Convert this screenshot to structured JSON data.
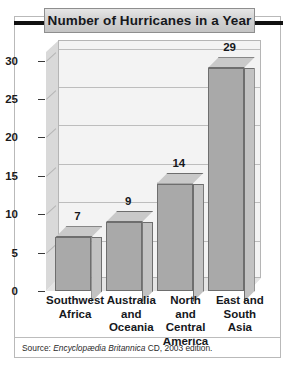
{
  "figure": {
    "title": "Number of Hurricanes in a Year",
    "source_prefix": "Source:",
    "source_work": "Encyclopædia Britannica",
    "source_suffix": "CD, 2003 edition."
  },
  "chart_data": {
    "type": "bar",
    "title": "Number of Hurricanes in a Year",
    "xlabel": "",
    "ylabel": "",
    "categories": [
      "Southwest Africa",
      "Australia and Oceania",
      "North and Central America",
      "East and South Asia"
    ],
    "category_lines": [
      [
        "Southwest",
        "Africa"
      ],
      [
        "Australia",
        "and",
        "Oceania"
      ],
      [
        "North and",
        "Central",
        "America"
      ],
      [
        "East and",
        "South Asia"
      ]
    ],
    "values": [
      7,
      9,
      14,
      29
    ],
    "value_labels": [
      "7",
      "9",
      "14",
      "29"
    ],
    "ylim": [
      0,
      31
    ],
    "yticks": [
      0,
      5,
      10,
      15,
      20,
      25,
      30
    ],
    "ytick_labels": [
      "0",
      "5",
      "10",
      "15",
      "20",
      "25",
      "30"
    ],
    "grid": true,
    "legend": "none",
    "style": "3d-column",
    "colors": {
      "bar_front": "#a9a9a9",
      "bar_top": "#c9c9c9",
      "bar_side": "#c2c2c2",
      "bar_outline": "#6e6e6e",
      "plot_background": "#f3f3f3",
      "gridline": "#bdbdbd",
      "wall_left": "#d9d9d9",
      "floor": "#e4e4e4",
      "title_band": "#d2d2d2",
      "frame": "#b9b9b9",
      "text": "#16181c"
    }
  }
}
